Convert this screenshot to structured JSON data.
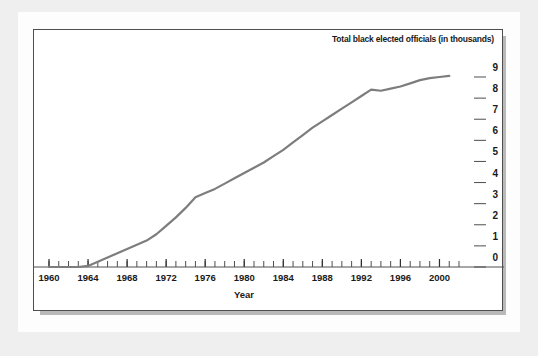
{
  "figure": {
    "background_color": "#efefef",
    "paper_color": "#fdfdfd",
    "frame_border_color": "#4e4e4e",
    "shadow_color": "#b9b9b9"
  },
  "chart_data": {
    "type": "line",
    "title": "Total black elected officials (in thousands)",
    "xlabel": "Year",
    "ylabel": "",
    "xlim": [
      1960,
      2002
    ],
    "ylim": [
      0,
      9.3
    ],
    "grid": false,
    "legend": null,
    "y_axis_position": "right",
    "line_color": "#7d7d7d",
    "line_width": 2.2,
    "xticks": [
      1960,
      1964,
      1968,
      1972,
      1976,
      1980,
      1984,
      1988,
      1992,
      1996,
      2000
    ],
    "xtick_labels": [
      "1960",
      "1964",
      "1968",
      "1972",
      "1976",
      "1980",
      "1984",
      "1988",
      "1992",
      "1996",
      "2000"
    ],
    "x_minor_tick_interval": 1,
    "yticks": [
      0,
      1,
      2,
      3,
      4,
      5,
      6,
      7,
      8,
      9
    ],
    "ytick_labels": [
      "0",
      "1",
      "2",
      "3",
      "4",
      "5",
      "6",
      "7",
      "8",
      "9"
    ],
    "x": [
      1960,
      1961,
      1962,
      1963,
      1964,
      1965,
      1966,
      1967,
      1968,
      1969,
      1970,
      1971,
      1972,
      1973,
      1974,
      1975,
      1976,
      1977,
      1978,
      1979,
      1980,
      1981,
      1982,
      1983,
      1984,
      1985,
      1986,
      1987,
      1988,
      1989,
      1990,
      1991,
      1992,
      1993,
      1994,
      1995,
      1996,
      1997,
      1998,
      1999,
      2000,
      2001
    ],
    "values": [
      0.0,
      0.0,
      0.0,
      0.0,
      0.05,
      0.25,
      0.45,
      0.65,
      0.85,
      1.05,
      1.25,
      1.55,
      1.95,
      2.35,
      2.8,
      3.3,
      3.5,
      3.7,
      3.95,
      4.2,
      4.45,
      4.7,
      4.95,
      5.25,
      5.55,
      5.9,
      6.25,
      6.6,
      6.9,
      7.2,
      7.5,
      7.8,
      8.1,
      8.4,
      8.35,
      8.45,
      8.55,
      8.7,
      8.85,
      8.95,
      9.0,
      9.05
    ],
    "series_name": "Total black elected officials"
  }
}
